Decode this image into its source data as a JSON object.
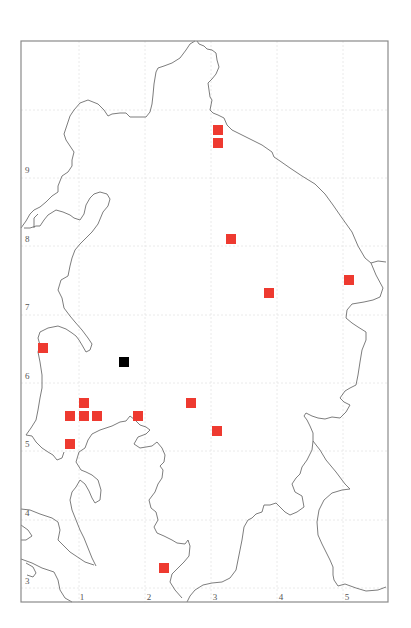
{
  "map": {
    "type": "distribution-grid-map",
    "frame": {
      "x0": 21,
      "y0": 41,
      "x1": 388,
      "y1": 602
    },
    "colors": {
      "record": "#ee3a30",
      "special_record": "#000000",
      "frame": "#8a8a8a",
      "coast": "#6e6e6e",
      "grid": "#e4e4e4",
      "label": "#555555"
    },
    "x_axis": {
      "labels": [
        "1",
        "2",
        "3",
        "4",
        "5"
      ],
      "positions": [
        82,
        149,
        215,
        281,
        347
      ],
      "label_y": 600
    },
    "y_axis": {
      "labels": [
        "9",
        "8",
        "7",
        "6",
        "5",
        "4",
        "3"
      ],
      "positions": [
        173,
        242,
        310,
        379,
        447,
        516,
        584
      ],
      "label_x": 25
    },
    "grid_lines": {
      "vertical": [
        79,
        145,
        211,
        277,
        343
      ],
      "horizontal": [
        110,
        178,
        246,
        315,
        383,
        451,
        520,
        588
      ]
    },
    "records": [
      {
        "x": 218,
        "y": 130,
        "kind": "red"
      },
      {
        "x": 218,
        "y": 143,
        "kind": "red"
      },
      {
        "x": 231,
        "y": 239,
        "kind": "red"
      },
      {
        "x": 269,
        "y": 293,
        "kind": "red"
      },
      {
        "x": 349,
        "y": 280,
        "kind": "red"
      },
      {
        "x": 43,
        "y": 348,
        "kind": "red"
      },
      {
        "x": 84,
        "y": 403,
        "kind": "red"
      },
      {
        "x": 70,
        "y": 416,
        "kind": "red"
      },
      {
        "x": 84,
        "y": 416,
        "kind": "red"
      },
      {
        "x": 97,
        "y": 416,
        "kind": "red"
      },
      {
        "x": 138,
        "y": 416,
        "kind": "red"
      },
      {
        "x": 191,
        "y": 403,
        "kind": "red"
      },
      {
        "x": 217,
        "y": 431,
        "kind": "red"
      },
      {
        "x": 70,
        "y": 444,
        "kind": "red"
      },
      {
        "x": 164,
        "y": 568,
        "kind": "red"
      },
      {
        "x": 124,
        "y": 362,
        "kind": "black"
      }
    ],
    "marker_size": 10
  }
}
